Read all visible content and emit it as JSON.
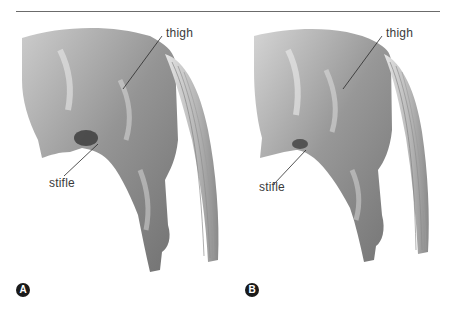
{
  "figure": {
    "panels": [
      {
        "id": "A",
        "badge": "A",
        "labels": {
          "thigh": "thigh",
          "stifle": "stifle"
        }
      },
      {
        "id": "B",
        "badge": "B",
        "labels": {
          "thigh": "thigh",
          "stifle": "stifle"
        }
      }
    ],
    "colors": {
      "rule": "#6b6b6b",
      "badge": "#1a1a1a",
      "label_text": "#3a3a3a",
      "sketch_dark": "#4a4a4a",
      "sketch_mid": "#9a9a9a",
      "sketch_light": "#d8d8d8"
    }
  }
}
